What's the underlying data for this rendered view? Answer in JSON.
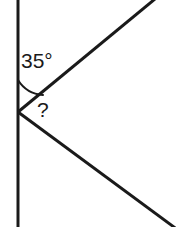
{
  "figure": {
    "kind": "geometry-angle-diagram",
    "width": 176,
    "height": 227,
    "background_color": "#ffffff",
    "stroke_color": "#1a1a1a",
    "labels": {
      "known_angle": "35°",
      "unknown_angle": "?"
    },
    "vertex": {
      "x": 18,
      "y": 112
    },
    "elements": {
      "vertical_line": {
        "name": "vertical-transversal-line",
        "x1": 18,
        "y1": 0,
        "x2": 18,
        "y2": 227,
        "stroke_width": 3
      },
      "upper_ray": {
        "name": "upper-ray",
        "x1": 18,
        "y1": 112,
        "x2": 176,
        "y2": -18,
        "stroke_width": 3
      },
      "lower_ray": {
        "name": "lower-ray",
        "x1": 18,
        "y1": 112,
        "x2": 176,
        "y2": 228,
        "stroke_width": 3
      },
      "angle_arc": {
        "name": "angle-arc-35",
        "path": "M 18 82 A 30 30 0 0 0 41 94",
        "stroke_width": 2
      }
    }
  }
}
